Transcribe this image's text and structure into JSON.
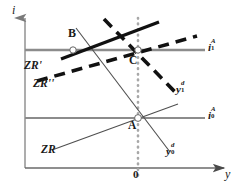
{
  "figure": {
    "background": "#ffffff",
    "width": 238,
    "height": 190
  },
  "colors": {
    "axis": "#8a8a8a",
    "thin_line": "#6e6e6e",
    "horizontal_line": "#8c8c8c",
    "bold_line": "#111111",
    "dashed_line": "#111111",
    "dotted_line": "#a6a6a6",
    "text": "#1a1a1a",
    "marker_fill": "#ffffff",
    "marker_stroke": "#555555"
  },
  "axes": {
    "y_axis": {
      "name": "vertical-axis",
      "label": "i",
      "label_x": 13,
      "label_y": 6,
      "x": 25,
      "y_top": 14,
      "y_bottom": 168,
      "arrow": "up"
    },
    "x_axis": {
      "name": "horizontal-axis",
      "label": "y",
      "label_x": 224,
      "label_y": 172,
      "y": 168,
      "x_left": 25,
      "x_right": 228,
      "arrow": "right"
    },
    "origin_tick": {
      "label": "0",
      "x": 138,
      "label_x": 134,
      "label_y": 171
    }
  },
  "vertical_dotted": {
    "name": "potential-output-line",
    "x": 138,
    "y_top": 18,
    "y_bottom": 180,
    "style": "dotted"
  },
  "horizontal_lines": [
    {
      "name": "interest-rate-line-i1A",
      "label": "i",
      "sub": "1",
      "sup": "A",
      "y": 50,
      "x_start": 25,
      "x_end": 205,
      "label_x": 208,
      "label_y": 41,
      "style": "solid-gray"
    },
    {
      "name": "interest-rate-line-i0A",
      "label": "i",
      "sub": "0",
      "sup": "A",
      "y": 118,
      "x_start": 25,
      "x_end": 205,
      "label_x": 208,
      "label_y": 109,
      "style": "solid-gray"
    }
  ],
  "curves": [
    {
      "name": "zr-curve",
      "label": "ZR",
      "style": "thin-solid",
      "x1": 52,
      "y1": 150,
      "x2": 178,
      "y2": 104,
      "label_x": 42,
      "label_y": 146
    },
    {
      "name": "yd0-curve",
      "label": "y",
      "sub": "0",
      "sup": "d",
      "style": "thin-solid",
      "x1": 76,
      "y1": 28,
      "x2": 170,
      "y2": 152,
      "label_x": 168,
      "label_y": 146
    },
    {
      "name": "zr-prime-curve",
      "label": "ZR'",
      "style": "thick-solid",
      "x1": 62,
      "y1": 59,
      "x2": 158,
      "y2": 22,
      "label_x": 25,
      "label_y": 62
    },
    {
      "name": "zr-double-prime-curve",
      "label": "ZR''",
      "style": "thick-dashed",
      "x1": 37,
      "y1": 81,
      "x2": 196,
      "y2": 36,
      "label_x": 34,
      "label_y": 79
    },
    {
      "name": "yd1-curve",
      "label": "y",
      "sub": "1",
      "sup": "d",
      "style": "thick-dashed",
      "x1": 104,
      "y1": 19,
      "x2": 176,
      "y2": 93,
      "label_x": 176,
      "label_y": 84
    }
  ],
  "points": [
    {
      "name": "equilibrium-point-b",
      "label": "B",
      "x": 73,
      "y": 50,
      "label_x": 69,
      "label_y": 30
    },
    {
      "name": "equilibrium-point-c",
      "label": "C",
      "x": 138,
      "y": 50,
      "label_x": 130,
      "label_y": 57
    },
    {
      "name": "equilibrium-point-a",
      "label": "A",
      "x": 138,
      "y": 118,
      "label_x": 129,
      "label_y": 122
    }
  ]
}
